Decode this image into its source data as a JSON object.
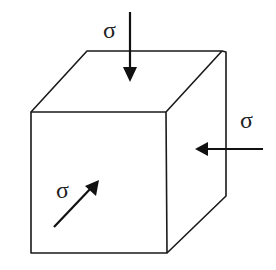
{
  "diagram": {
    "title": "",
    "type": "stress-cube",
    "colors": {
      "line": "#1a1a1a",
      "arrow": "#111111",
      "text": "#222222",
      "background": "#ffffff"
    },
    "labels": {
      "top": "σ",
      "right": "σ",
      "front": "σ"
    },
    "arrows": [
      {
        "name": "top-stress",
        "direction": "down",
        "label": "σ"
      },
      {
        "name": "right-stress",
        "direction": "left",
        "label": "σ"
      },
      {
        "name": "front-stress",
        "direction": "diagonal-up-right",
        "label": "σ"
      }
    ]
  }
}
